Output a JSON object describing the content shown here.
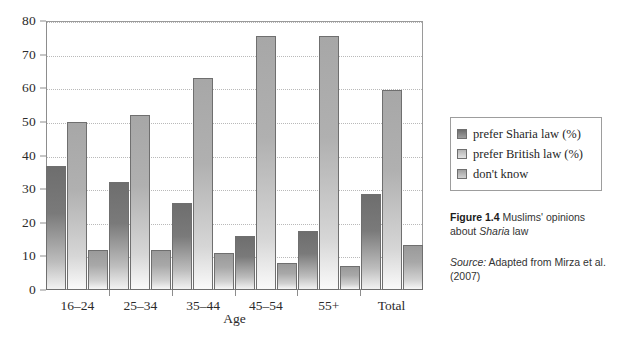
{
  "chart_data": {
    "type": "bar",
    "title": "",
    "xlabel": "Age",
    "ylabel": "",
    "ylim": [
      0,
      80
    ],
    "ytick_labels": [
      "0",
      "10",
      "20",
      "30",
      "40",
      "50",
      "60",
      "70",
      "80"
    ],
    "yticks": [
      0,
      10,
      20,
      30,
      40,
      50,
      60,
      70,
      80
    ],
    "grid": "horizontal-dotted",
    "legend_position": "right",
    "categories": [
      "16–24",
      "25–34",
      "35–44",
      "45–54",
      "55+",
      "Total"
    ],
    "series": [
      {
        "name": "prefer Sharia law (%)",
        "color": "#7a7a7a",
        "values": [
          37,
          32,
          26,
          16,
          17.5,
          28.5
        ]
      },
      {
        "name": "prefer British law (%)",
        "color": "#b0b0b0",
        "values": [
          50,
          52,
          63,
          75.5,
          75.5,
          59.5
        ]
      },
      {
        "name": "don't know",
        "color": "#a8a8a8",
        "values": [
          12,
          12,
          11,
          8,
          7,
          13.5
        ]
      }
    ]
  },
  "legend": {
    "items": [
      {
        "label": "prefer Sharia law (%)"
      },
      {
        "label": "prefer British law (%)"
      },
      {
        "label": "don't know"
      }
    ]
  },
  "caption": {
    "figure_number": "Figure 1.4",
    "text_before_italic": " Muslims' opinions about ",
    "italic_term": "Sharia",
    "text_after_italic": " law",
    "source_label": "Source:",
    "source_text": " Adapted from Mirza et al. (2007)"
  }
}
